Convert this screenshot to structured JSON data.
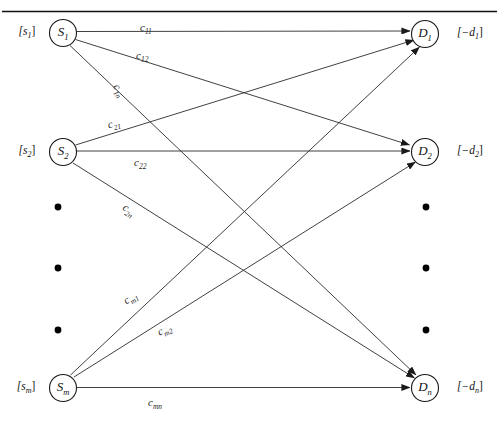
{
  "figure": {
    "kind": "bipartite-transportation-network",
    "top_rule": true,
    "canvas": {
      "width": 499,
      "height": 424
    }
  },
  "sources": [
    {
      "id": "s1",
      "node_label": "S",
      "node_sub": "1",
      "supply_label": "[s",
      "supply_sub": "1",
      "supply_tail": "]",
      "cx": 63,
      "cy": 33
    },
    {
      "id": "s2",
      "node_label": "S",
      "node_sub": "2",
      "supply_label": "[s",
      "supply_sub": "2",
      "supply_tail": "]",
      "cx": 63,
      "cy": 152
    },
    {
      "id": "sm",
      "node_label": "S",
      "node_sub": "m",
      "supply_label": "[s",
      "supply_sub": "m",
      "supply_tail": "]",
      "cx": 63,
      "cy": 388
    }
  ],
  "destinations": [
    {
      "id": "d1",
      "node_label": "D",
      "node_sub": "1",
      "demand_label": "[−d",
      "demand_sub": "1",
      "demand_tail": "]",
      "cx": 425,
      "cy": 34
    },
    {
      "id": "d2",
      "node_label": "D",
      "node_sub": "2",
      "demand_label": "[−d",
      "demand_sub": "2",
      "demand_tail": "]",
      "cx": 425,
      "cy": 152
    },
    {
      "id": "dn",
      "node_label": "D",
      "node_sub": "n",
      "demand_label": "[−d",
      "demand_sub": "n",
      "demand_tail": "]",
      "cx": 425,
      "cy": 388
    }
  ],
  "edges": [
    {
      "id": "e11",
      "from": "s1",
      "to": "d1",
      "cost": "c",
      "cost_sub": "11",
      "label_x": 140,
      "label_y": 22,
      "rotate": 0
    },
    {
      "id": "e12",
      "from": "s1",
      "to": "d2",
      "cost": "c",
      "cost_sub": "12",
      "label_x": 136,
      "label_y": 50,
      "rotate": 0
    },
    {
      "id": "e1n",
      "from": "s1",
      "to": "dn",
      "cost": "c",
      "cost_sub": "1n",
      "label_x": 112,
      "label_y": 84,
      "rotate": 57
    },
    {
      "id": "e21",
      "from": "s2",
      "to": "d1",
      "cost": "c",
      "cost_sub": "21",
      "label_x": 108,
      "label_y": 118,
      "rotate": -16
    },
    {
      "id": "e22",
      "from": "s2",
      "to": "d2",
      "cost": "c",
      "cost_sub": "22",
      "label_x": 134,
      "label_y": 157,
      "rotate": 0
    },
    {
      "id": "e2n",
      "from": "s2",
      "to": "dn",
      "cost": "c",
      "cost_sub": "2n",
      "label_x": 122,
      "label_y": 204,
      "rotate": 35
    },
    {
      "id": "em1",
      "from": "sm",
      "to": "d1",
      "cost": "c",
      "cost_sub": "m1",
      "label_x": 124,
      "label_y": 292,
      "rotate": -33
    },
    {
      "id": "em2",
      "from": "sm",
      "to": "d2",
      "cost": "c",
      "cost_sub": "m2",
      "label_x": 158,
      "label_y": 324,
      "rotate": -25
    },
    {
      "id": "emn",
      "from": "sm",
      "to": "dn",
      "cost": "c",
      "cost_sub": "mn",
      "label_x": 148,
      "label_y": 397,
      "rotate": 0
    }
  ],
  "ellipsis": {
    "left_x": 58,
    "right_x": 426,
    "ys": [
      207,
      268,
      330
    ]
  },
  "colors": {
    "stroke": "#2b2b2b",
    "node_stroke": "#1a1a1a",
    "text": "#111111",
    "background": "#ffffff"
  }
}
